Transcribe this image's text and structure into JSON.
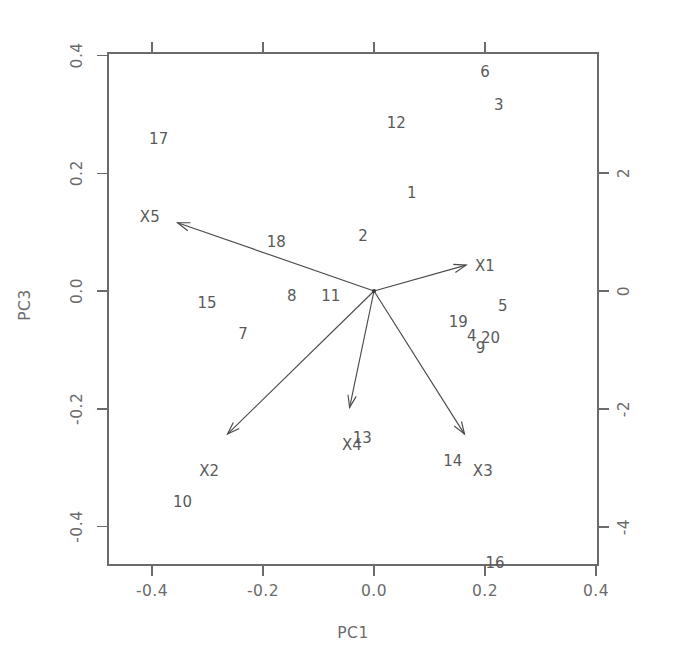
{
  "chart_data": {
    "type": "scatter",
    "subtype": "pca-biplot",
    "title": "",
    "xlabel": "PC1",
    "ylabel": "PC3",
    "xlim": [
      -0.5,
      0.48
    ],
    "ylim": [
      -0.52,
      0.44
    ],
    "grid": false,
    "legend": null,
    "bottom_axis": {
      "label": "PC1",
      "ticks": [
        -0.4,
        -0.2,
        0.0,
        0.2,
        0.4
      ],
      "tick_labels": [
        "-0.4",
        "-0.2",
        "0.0",
        "0.2",
        "0.4"
      ]
    },
    "left_axis": {
      "label": "PC3",
      "ticks": [
        -0.4,
        -0.2,
        0.0,
        0.2,
        0.4
      ],
      "tick_labels": [
        "-0.4",
        "-0.2",
        "0.0",
        "0.2",
        "0.4"
      ]
    },
    "top_axis": {
      "label": "",
      "ticks": [
        -4,
        -2,
        0,
        2
      ],
      "tick_labels": [
        "",
        "",
        "",
        ""
      ]
    },
    "right_axis": {
      "label": "",
      "ticks": [
        -4,
        -2,
        0,
        2
      ],
      "tick_labels": [
        "-4",
        "-2",
        "0",
        "2"
      ]
    },
    "observations": [
      {
        "label": "1",
        "x": 0.068,
        "y": 0.166
      },
      {
        "label": "2",
        "x": -0.02,
        "y": 0.094
      },
      {
        "label": "3",
        "x": 0.225,
        "y": 0.315
      },
      {
        "label": "4",
        "x": 0.176,
        "y": -0.076
      },
      {
        "label": "5",
        "x": 0.232,
        "y": -0.026
      },
      {
        "label": "6",
        "x": 0.2,
        "y": 0.371
      },
      {
        "label": "7",
        "x": -0.236,
        "y": -0.073
      },
      {
        "label": "8",
        "x": -0.148,
        "y": -0.008
      },
      {
        "label": "9",
        "x": 0.192,
        "y": -0.097
      },
      {
        "label": "10",
        "x": -0.345,
        "y": -0.358
      },
      {
        "label": "11",
        "x": -0.078,
        "y": -0.008
      },
      {
        "label": "12",
        "x": 0.04,
        "y": 0.285
      },
      {
        "label": "13",
        "x": -0.021,
        "y": -0.25
      },
      {
        "label": "14",
        "x": 0.142,
        "y": -0.288
      },
      {
        "label": "15",
        "x": -0.301,
        "y": -0.02
      },
      {
        "label": "16",
        "x": 0.218,
        "y": -0.462
      },
      {
        "label": "17",
        "x": -0.388,
        "y": 0.258
      },
      {
        "label": "18",
        "x": -0.176,
        "y": 0.083
      },
      {
        "label": "19",
        "x": 0.152,
        "y": -0.052
      },
      {
        "label": "20",
        "x": 0.21,
        "y": -0.08
      }
    ],
    "variable_vectors": [
      {
        "label": "X1",
        "x": 0.166,
        "y": 0.044
      },
      {
        "label": "X2",
        "x": -0.264,
        "y": -0.243
      },
      {
        "label": "X3",
        "x": 0.163,
        "y": -0.243
      },
      {
        "label": "X4",
        "x": -0.044,
        "y": -0.198
      },
      {
        "label": "X5",
        "x": -0.354,
        "y": 0.116
      }
    ],
    "variable_label_offsets": [
      {
        "label": "X1",
        "x": 0.2,
        "y": 0.042
      },
      {
        "label": "X2",
        "x": -0.297,
        "y": -0.305
      },
      {
        "label": "X3",
        "x": 0.196,
        "y": -0.305
      },
      {
        "label": "X4",
        "x": -0.04,
        "y": -0.262
      },
      {
        "label": "X5",
        "x": -0.404,
        "y": 0.126
      }
    ]
  },
  "figure": {
    "background": "#ffffff",
    "axis_color": "#6b6b6b",
    "text_color": "#6b6b6b",
    "vector_color": "#4a4a4a",
    "point_label_color": "#5a5a5a"
  }
}
